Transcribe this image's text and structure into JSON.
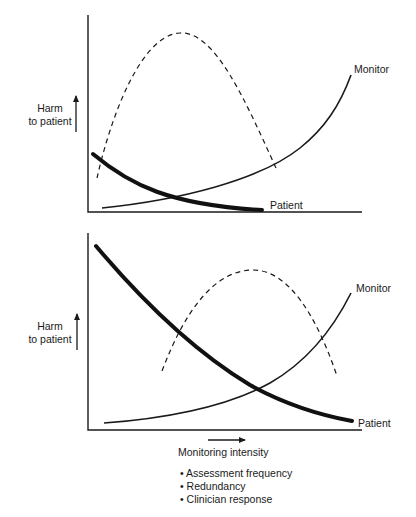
{
  "panels": [
    {
      "id": "top",
      "y_label_line1": "Harm",
      "y_label_line2": "to patient",
      "curves": {
        "monitor_label": "Monitor",
        "patient_label": "Patient"
      }
    },
    {
      "id": "bottom",
      "y_label_line1": "Harm",
      "y_label_line2": "to patient",
      "curves": {
        "monitor_label": "Monitor",
        "patient_label": "Patient"
      }
    }
  ],
  "x_axis": {
    "label": "Monitoring intensity",
    "bullets": [
      "• Assessment frequency",
      "• Redundancy",
      "• Clinician response"
    ]
  },
  "colors": {
    "line": "#1a1a1a",
    "background": "#ffffff"
  }
}
